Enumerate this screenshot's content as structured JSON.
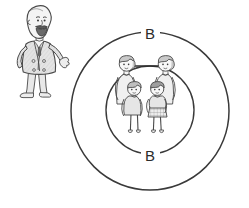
{
  "illustration": {
    "title": "Family system boundary diagram",
    "style": "hand-drawn pen sketch, grayscale",
    "background_color": "#ffffff",
    "ink_color": "#3a3a3a",
    "shade_color": "#cfcfcf"
  },
  "labels": {
    "outer_boundary": "B",
    "inner_boundary": "B"
  },
  "circles": {
    "outer": {
      "cx": 150,
      "cy": 111,
      "r": 79,
      "label": "B",
      "label_position": "top"
    },
    "inner": {
      "cx": 150,
      "cy": 110,
      "r": 44,
      "label": "B",
      "label_position": "bottom"
    }
  },
  "figures": {
    "observer": {
      "name": "bearded-man",
      "description": "standing bearded man in suit, gesturing with right hand",
      "position": "left"
    },
    "family": [
      {
        "name": "adult-left",
        "role": "parent",
        "position": "back-left"
      },
      {
        "name": "adult-right",
        "role": "parent",
        "position": "back-right"
      },
      {
        "name": "child-left",
        "role": "child",
        "position": "front-left"
      },
      {
        "name": "child-right",
        "role": "child",
        "position": "front-right",
        "detail": "checkered skirt"
      }
    ],
    "connector": {
      "name": "couple-link",
      "from": "adult-left",
      "to": "adult-right"
    }
  }
}
